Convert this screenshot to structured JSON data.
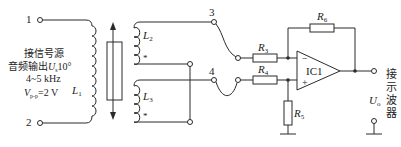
{
  "diagram": {
    "terminals": {
      "t1": "1",
      "t2": "2",
      "t3": "3",
      "t4": "4"
    },
    "source_label": {
      "line1": "接信号源",
      "line2_prefix": "音频输出",
      "line2_var": "U",
      "line2_sub": "s",
      "line2_suffix": "10°",
      "line3": "4~5 kHz",
      "line4_var": "V",
      "line4_sub": "p-p",
      "line4_suffix": "=2 V"
    },
    "coils": {
      "L1": {
        "name": "L",
        "sub": "1"
      },
      "L2": {
        "name": "L",
        "sub": "2"
      },
      "L3": {
        "name": "L",
        "sub": "3"
      },
      "dot_marker": "*"
    },
    "resistors": {
      "R3": {
        "name": "R",
        "sub": "3"
      },
      "R4": {
        "name": "R",
        "sub": "4"
      },
      "R5": {
        "name": "R",
        "sub": "5"
      },
      "R6": {
        "name": "R",
        "sub": "6"
      }
    },
    "opamp": {
      "label": "IC1",
      "minus": "−",
      "plus": "+"
    },
    "output": {
      "var": "U",
      "sub": "o",
      "scope_label": [
        "接",
        "示",
        "波",
        "器"
      ]
    }
  }
}
